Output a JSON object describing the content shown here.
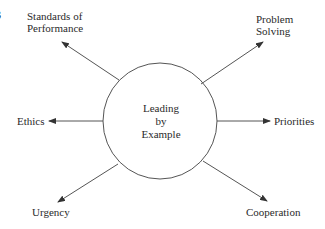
{
  "figure": {
    "clipped_fragment": "3",
    "center": {
      "lines": [
        "Leading",
        "by",
        "Example"
      ],
      "cx": 160,
      "cy": 121,
      "rx": 57,
      "ry": 58
    },
    "nodes": {
      "standards": {
        "lines": [
          "Standards of",
          "Performance"
        ]
      },
      "problem": {
        "lines": [
          "Problem",
          "Solving"
        ]
      },
      "ethics": {
        "lines": [
          "Ethics"
        ]
      },
      "priorities": {
        "lines": [
          "Priorities"
        ]
      },
      "urgency": {
        "lines": [
          "Urgency"
        ]
      },
      "cooperation": {
        "lines": [
          "Cooperation"
        ]
      }
    },
    "colors": {
      "stroke": "#555555",
      "text": "#2a2a2a",
      "background": "#ffffff"
    }
  }
}
